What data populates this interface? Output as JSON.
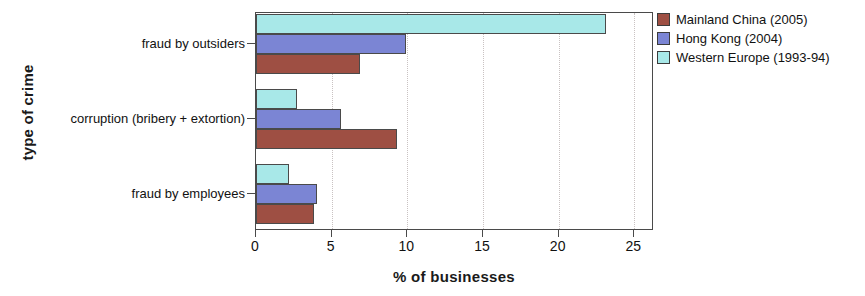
{
  "chart_data": {
    "type": "bar",
    "orientation": "horizontal",
    "title": "",
    "xlabel": "% of businesses",
    "ylabel": "type of crime",
    "categories": [
      "fraud by outsiders",
      "corruption (bribery + extortion)",
      "fraud by employees"
    ],
    "series": [
      {
        "name": "Mainland China (2005)",
        "color": "#9e4f43",
        "values": [
          6.9,
          9.3,
          3.8
        ]
      },
      {
        "name": "Hong Kong (2004)",
        "color": "#7b85d4",
        "values": [
          9.9,
          5.6,
          4.0
        ]
      },
      {
        "name": "Western Europe (1993-94)",
        "color": "#a8e8e8",
        "values": [
          23.1,
          2.7,
          2.2
        ]
      }
    ],
    "xlim": [
      0,
      26.3
    ],
    "xticks": [
      0,
      5,
      10,
      15,
      20,
      25
    ],
    "xtick_labels": [
      "0",
      "5",
      "10",
      "15",
      "20",
      "25"
    ],
    "grid": "vertical-dotted",
    "legend_position": "right-top"
  },
  "legend": {
    "entries": [
      {
        "label": "Mainland China (2005)",
        "color": "#9e4f43"
      },
      {
        "label": "Hong Kong (2004)",
        "color": "#7b85d4"
      },
      {
        "label": "Western Europe (1993-94)",
        "color": "#a8e8e8"
      }
    ]
  },
  "axes": {
    "x_title": "% of businesses",
    "y_title": "type of crime"
  }
}
